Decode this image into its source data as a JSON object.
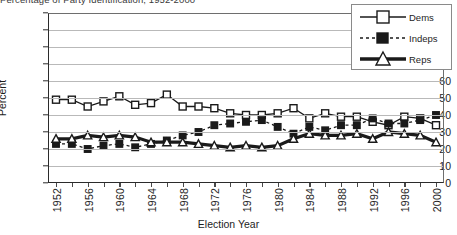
{
  "title_clipped": "Percentage of Party Identification, 1952-2000",
  "axes": {
    "ylabel": "Percent",
    "xlabel": "Election Year",
    "yticks": [
      0,
      10,
      20,
      30,
      40,
      50,
      60,
      70,
      80,
      90,
      100
    ],
    "xticks_labeled": [
      "1952",
      "1956",
      "1960",
      "1964",
      "1968",
      "1972",
      "1976",
      "1980",
      "1984",
      "1988",
      "1992",
      "1996",
      "2000"
    ]
  },
  "legend": {
    "items": [
      {
        "label": "Dems",
        "glyph": "open-square-solid-line",
        "color": "#1a1a1a"
      },
      {
        "label": "Indeps",
        "glyph": "filled-square-dashed-line",
        "color": "#1a1a1a"
      },
      {
        "label": "Reps",
        "glyph": "open-triangle-thick-line",
        "color": "#1a1a1a"
      }
    ]
  },
  "chart_data": {
    "type": "line",
    "title": "Percentage of Party Identification, 1952-2000",
    "xlabel": "Election Year",
    "ylabel": "Percent",
    "ylim": [
      0,
      100
    ],
    "ytick_step": 10,
    "grid": true,
    "legend_position": "top-right",
    "x": [
      1952,
      1954,
      1956,
      1958,
      1960,
      1962,
      1964,
      1966,
      1968,
      1970,
      1972,
      1974,
      1976,
      1978,
      1980,
      1982,
      1984,
      1986,
      1988,
      1990,
      1992,
      1994,
      1996,
      1998,
      2000
    ],
    "series": [
      {
        "name": "Dems",
        "marker": "open-square",
        "line": "solid",
        "values": [
          49,
          49,
          45,
          48,
          51,
          46,
          47,
          52,
          45,
          45,
          44,
          41,
          40,
          40,
          41,
          44,
          38,
          41,
          39,
          39,
          36,
          34,
          39,
          38,
          34
        ]
      },
      {
        "name": "Indeps",
        "marker": "filled-square",
        "line": "dashed",
        "values": [
          23,
          23,
          20,
          22,
          23,
          21,
          23,
          25,
          28,
          30,
          34,
          35,
          36,
          37,
          33,
          29,
          33,
          31,
          34,
          34,
          38,
          35,
          35,
          37,
          40
        ]
      },
      {
        "name": "Reps",
        "marker": "open-triangle",
        "line": "thick-solid",
        "values": [
          26,
          26,
          28,
          27,
          28,
          27,
          24,
          24,
          24,
          23,
          22,
          21,
          22,
          21,
          22,
          26,
          29,
          28,
          28,
          29,
          26,
          30,
          29,
          28,
          24
        ]
      }
    ]
  }
}
